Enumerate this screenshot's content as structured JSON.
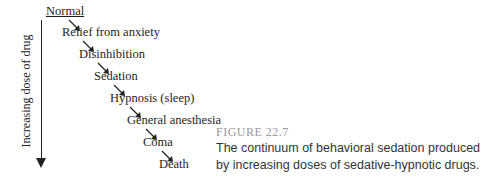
{
  "diagram": {
    "axis_label": "Increasing dose of drug",
    "stages": [
      {
        "label": "Normal"
      },
      {
        "label": "Relief from anxiety"
      },
      {
        "label": "Disinhibition"
      },
      {
        "label": "Sedation"
      },
      {
        "label": "Hypnosis (sleep)"
      },
      {
        "label": "General anesthesia"
      },
      {
        "label": "Coma"
      },
      {
        "label": "Death"
      }
    ]
  },
  "caption": {
    "title": "FIGURE 22.7",
    "body": "The continuum of behavioral sedation produced by increasing doses of sedative-hypnotic drugs."
  }
}
